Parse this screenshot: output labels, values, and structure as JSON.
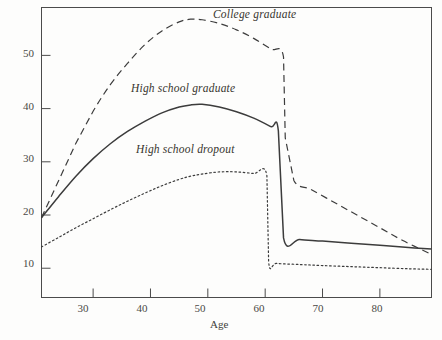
{
  "chart_data": {
    "type": "line",
    "title": "",
    "xlabel": "Age",
    "ylabel": "",
    "xlim": [
      21,
      89
    ],
    "ylim": [
      4.5,
      59
    ],
    "grid": false,
    "legend_position": "inline-annotations",
    "xticks": [
      30,
      40,
      50,
      60,
      70,
      80
    ],
    "xtick_labels": [
      "30",
      "40",
      "50",
      "60",
      "70",
      "80"
    ],
    "yticks": [
      10,
      20,
      30,
      40,
      50
    ],
    "ytick_labels": [
      "10",
      "20",
      "30",
      "40",
      "50"
    ],
    "series": [
      {
        "name": "College graduate",
        "style": "dashed",
        "color": "#3c3c3c",
        "x": [
          21,
          24,
          27,
          30,
          33,
          36,
          39,
          42,
          45,
          47,
          49,
          52,
          55,
          58,
          61,
          63.2,
          63.5,
          65,
          68,
          72,
          76,
          80,
          84,
          89
        ],
        "values": [
          19.5,
          26.5,
          33.5,
          39.5,
          44.5,
          48.5,
          52.0,
          54.6,
          56.3,
          56.8,
          56.7,
          56.0,
          54.8,
          53.2,
          51.2,
          49.7,
          34.5,
          26.5,
          24.8,
          22.4,
          20.0,
          17.6,
          15.2,
          12.6
        ]
      },
      {
        "name": "High school graduate",
        "style": "solid",
        "color": "#3c3c3c",
        "x": [
          21,
          24,
          27,
          30,
          33,
          36,
          39,
          42,
          45,
          47,
          49,
          52,
          55,
          58,
          61,
          62.3,
          63.2,
          66,
          70,
          75,
          80,
          85,
          89
        ],
        "values": [
          19.5,
          23.5,
          27.3,
          30.6,
          33.4,
          35.7,
          37.6,
          39.2,
          40.3,
          40.7,
          40.8,
          40.3,
          39.4,
          38.2,
          36.6,
          35.8,
          15.7,
          15.4,
          15.1,
          14.7,
          14.3,
          13.9,
          13.6
        ]
      },
      {
        "name": "High school dropout",
        "style": "dotted",
        "color": "#3c3c3c",
        "x": [
          21,
          24,
          27,
          30,
          33,
          36,
          39,
          42,
          45,
          47,
          49,
          52,
          55,
          58,
          60.3,
          60.6,
          62,
          66,
          70,
          75,
          80,
          85,
          89
        ],
        "values": [
          14.0,
          15.8,
          17.6,
          19.3,
          21.0,
          22.6,
          24.1,
          25.5,
          26.7,
          27.3,
          27.7,
          28.1,
          28.1,
          27.8,
          27.4,
          11.2,
          10.9,
          10.7,
          10.5,
          10.3,
          10.1,
          9.9,
          9.8
        ]
      }
    ],
    "annotations": [
      {
        "text": "College graduate",
        "x": 69,
        "y": 57.5
      },
      {
        "text": "High school graduate",
        "x": 47,
        "y": 43.5
      },
      {
        "text": "High school dropout",
        "x": 49,
        "y": 31.5
      }
    ]
  },
  "labels": {
    "xaxis_title": "Age",
    "series_college": "College graduate",
    "series_hsgrad": "High school graduate",
    "series_dropout": "High school dropout",
    "ytick_10": "10",
    "ytick_20": "20",
    "ytick_30": "30",
    "ytick_40": "40",
    "ytick_50": "50",
    "xtick_30": "30",
    "xtick_40": "40",
    "xtick_50": "50",
    "xtick_60": "60",
    "xtick_70": "70",
    "xtick_80": "80"
  },
  "colors": {
    "line": "#3c3c3c",
    "frame": "#4b4b4b",
    "text": "#3a3a3a",
    "background": "#fdfdfc"
  }
}
